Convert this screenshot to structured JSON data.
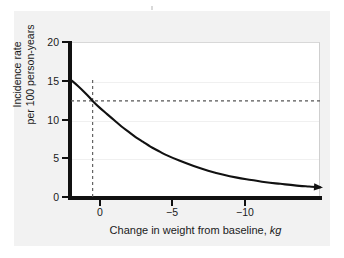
{
  "figure": {
    "background_color": "#f2f2f2",
    "plot_background_color": "#ffffff",
    "axis_color": "#111111",
    "curve_color": "#111111",
    "reference_line_color": "#555555",
    "gridline_color": "#f0f0f0"
  },
  "chart_data": {
    "type": "line",
    "title": "",
    "subtitle": "",
    "xlabel_text": "Change in weight from baseline,",
    "xlabel_unit": "kg",
    "ylabel_line1": "Incidence rate",
    "ylabel_line2": "per 100 person-years",
    "xlim": [
      1.5,
      -15.75
    ],
    "ylim": [
      0,
      20
    ],
    "x_ticks": [
      0,
      -5,
      -10
    ],
    "x_tick_labels": [
      "0",
      "−5",
      "−10"
    ],
    "y_ticks": [
      0,
      5,
      10,
      15,
      20
    ],
    "y_tick_labels": [
      "0",
      "5",
      "10",
      "15",
      "20"
    ],
    "grid": "horizontal-faint",
    "legend": "none",
    "series": [
      {
        "name": "Incidence rate vs weight change",
        "arrow_head": "right-end",
        "x": [
          1.5,
          1.0,
          0.5,
          0.0,
          -0.5,
          -1.0,
          -1.5,
          -2.0,
          -2.5,
          -3.0,
          -3.5,
          -4.0,
          -4.5,
          -5.0,
          -6.0,
          -7.0,
          -8.0,
          -9.0,
          -10.0,
          -11.0,
          -12.0,
          -13.0,
          -14.0,
          -15.0,
          -15.75
        ],
        "y": [
          15.1,
          14.3,
          13.4,
          12.4,
          11.5,
          10.7,
          9.9,
          9.1,
          8.4,
          7.7,
          7.1,
          6.5,
          6.0,
          5.5,
          4.7,
          4.0,
          3.4,
          2.9,
          2.5,
          2.2,
          1.9,
          1.7,
          1.5,
          1.35,
          1.25
        ]
      }
    ],
    "annotations": [
      {
        "name": "baseline-vertical-reference",
        "type": "vertical-dashed-line",
        "x": 0,
        "y_from": 0,
        "y_to": 15.3
      },
      {
        "name": "baseline-incidence-horizontal-reference",
        "type": "horizontal-dashed-line",
        "y": 12.4,
        "x_from": 1.5,
        "x_to": -15.75
      }
    ]
  }
}
